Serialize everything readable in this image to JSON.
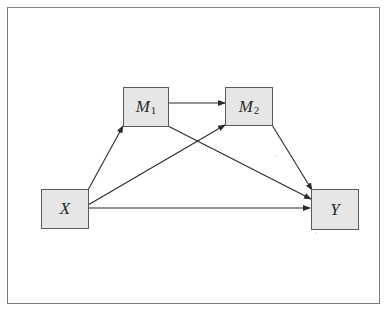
{
  "diagram": {
    "type": "path-mediation-model",
    "colors": {
      "node_fill": "#e6e6e6",
      "node_border": "#5a5a5a",
      "edge": "#2a2a2a",
      "frame": "#7a7a7a"
    },
    "nodes": [
      {
        "id": "X",
        "label": "X",
        "sub": ""
      },
      {
        "id": "M1",
        "label": "M",
        "sub": "1"
      },
      {
        "id": "M2",
        "label": "M",
        "sub": "2"
      },
      {
        "id": "Y",
        "label": "Y",
        "sub": ""
      }
    ],
    "edges": [
      {
        "from": "X",
        "to": "M1"
      },
      {
        "from": "X",
        "to": "M2"
      },
      {
        "from": "X",
        "to": "Y"
      },
      {
        "from": "M1",
        "to": "M2"
      },
      {
        "from": "M1",
        "to": "Y"
      },
      {
        "from": "M2",
        "to": "Y"
      }
    ]
  }
}
